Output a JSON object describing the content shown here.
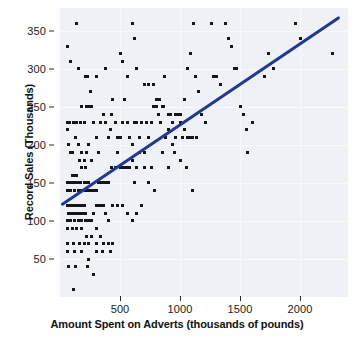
{
  "chart_data": {
    "type": "scatter",
    "title": "",
    "xlabel": "Amount Spent on Adverts (thousands of pounds)",
    "ylabel": "Record Sales (Thousands)",
    "xlim": [
      0,
      2400
    ],
    "ylim": [
      0,
      380
    ],
    "xticks": [
      500,
      1000,
      1500,
      2000
    ],
    "xticklabels": [
      "500",
      "1000",
      "1500",
      "2000"
    ],
    "yticks": [
      50,
      100,
      150,
      200,
      250,
      300,
      350
    ],
    "yticklabels": [
      "50",
      "100",
      "150",
      "200",
      "250",
      "300",
      "350"
    ],
    "grid": true,
    "legend": null,
    "panel_background": "#eef1f6",
    "point_color": "#15161a",
    "point_marker": "square",
    "series": [
      {
        "name": "Record sales vs advertising budget",
        "points": [
          [
            60,
            330
          ],
          [
            90,
            310
          ],
          [
            140,
            360
          ],
          [
            150,
            300
          ],
          [
            210,
            290
          ],
          [
            230,
            290
          ],
          [
            250,
            270
          ],
          [
            300,
            290
          ],
          [
            180,
            250
          ],
          [
            220,
            250
          ],
          [
            240,
            250
          ],
          [
            260,
            250
          ],
          [
            380,
            300
          ],
          [
            430,
            240
          ],
          [
            500,
            320
          ],
          [
            520,
            310
          ],
          [
            560,
            290
          ],
          [
            600,
            360
          ],
          [
            620,
            340
          ],
          [
            640,
            300
          ],
          [
            700,
            280
          ],
          [
            740,
            280
          ],
          [
            780,
            280
          ],
          [
            800,
            250
          ],
          [
            830,
            260
          ],
          [
            850,
            250
          ],
          [
            870,
            290
          ],
          [
            900,
            240
          ],
          [
            940,
            230
          ],
          [
            960,
            240
          ],
          [
            1000,
            240
          ],
          [
            1040,
            260
          ],
          [
            1060,
            300
          ],
          [
            1090,
            320
          ],
          [
            1110,
            360
          ],
          [
            1130,
            290
          ],
          [
            1150,
            270
          ],
          [
            1180,
            240
          ],
          [
            1210,
            230
          ],
          [
            1260,
            360
          ],
          [
            1280,
            290
          ],
          [
            1300,
            290
          ],
          [
            1340,
            280
          ],
          [
            1380,
            360
          ],
          [
            1400,
            340
          ],
          [
            1430,
            330
          ],
          [
            1450,
            300
          ],
          [
            1470,
            300
          ],
          [
            1500,
            250
          ],
          [
            1530,
            240
          ],
          [
            1550,
            220
          ],
          [
            1560,
            190
          ],
          [
            1600,
            230
          ],
          [
            1700,
            290
          ],
          [
            1740,
            320
          ],
          [
            1780,
            300
          ],
          [
            1960,
            360
          ],
          [
            2000,
            340
          ],
          [
            2270,
            320
          ],
          [
            60,
            230
          ],
          [
            80,
            230
          ],
          [
            110,
            230
          ],
          [
            140,
            230
          ],
          [
            170,
            230
          ],
          [
            200,
            230
          ],
          [
            60,
            220
          ],
          [
            70,
            200
          ],
          [
            90,
            190
          ],
          [
            100,
            190
          ],
          [
            130,
            210
          ],
          [
            150,
            200
          ],
          [
            160,
            180
          ],
          [
            180,
            190
          ],
          [
            200,
            180
          ],
          [
            220,
            190
          ],
          [
            240,
            200
          ],
          [
            260,
            180
          ],
          [
            280,
            230
          ],
          [
            300,
            210
          ],
          [
            320,
            190
          ],
          [
            340,
            230
          ],
          [
            360,
            240
          ],
          [
            380,
            230
          ],
          [
            400,
            210
          ],
          [
            420,
            220
          ],
          [
            440,
            260
          ],
          [
            460,
            230
          ],
          [
            480,
            210
          ],
          [
            500,
            210
          ],
          [
            520,
            230
          ],
          [
            540,
            260
          ],
          [
            560,
            230
          ],
          [
            580,
            210
          ],
          [
            600,
            200
          ],
          [
            620,
            230
          ],
          [
            640,
            230
          ],
          [
            660,
            210
          ],
          [
            680,
            230
          ],
          [
            700,
            190
          ],
          [
            720,
            230
          ],
          [
            740,
            210
          ],
          [
            760,
            230
          ],
          [
            780,
            250
          ],
          [
            800,
            260
          ],
          [
            820,
            240
          ],
          [
            840,
            230
          ],
          [
            860,
            250
          ],
          [
            880,
            210
          ],
          [
            900,
            220
          ],
          [
            920,
            240
          ],
          [
            940,
            200
          ],
          [
            960,
            210
          ],
          [
            980,
            240
          ],
          [
            1000,
            230
          ],
          [
            1020,
            210
          ],
          [
            1040,
            220
          ],
          [
            1060,
            210
          ],
          [
            1080,
            210
          ],
          [
            1100,
            210
          ],
          [
            1140,
            210
          ],
          [
            60,
            150
          ],
          [
            70,
            150
          ],
          [
            80,
            150
          ],
          [
            100,
            160
          ],
          [
            120,
            160
          ],
          [
            140,
            160
          ],
          [
            90,
            150
          ],
          [
            110,
            150
          ],
          [
            130,
            150
          ],
          [
            150,
            150
          ],
          [
            170,
            150
          ],
          [
            200,
            150
          ],
          [
            220,
            150
          ],
          [
            240,
            150
          ],
          [
            180,
            170
          ],
          [
            210,
            170
          ],
          [
            60,
            140
          ],
          [
            90,
            140
          ],
          [
            120,
            140
          ],
          [
            150,
            140
          ],
          [
            180,
            140
          ],
          [
            210,
            140
          ],
          [
            240,
            140
          ],
          [
            260,
            140
          ],
          [
            280,
            140
          ],
          [
            300,
            140
          ],
          [
            320,
            150
          ],
          [
            340,
            150
          ],
          [
            360,
            150
          ],
          [
            380,
            150
          ],
          [
            400,
            150
          ],
          [
            430,
            170
          ],
          [
            460,
            170
          ],
          [
            480,
            190
          ],
          [
            500,
            170
          ],
          [
            520,
            170
          ],
          [
            540,
            170
          ],
          [
            560,
            170
          ],
          [
            580,
            170
          ],
          [
            600,
            180
          ],
          [
            620,
            150
          ],
          [
            640,
            170
          ],
          [
            660,
            190
          ],
          [
            700,
            170
          ],
          [
            740,
            150
          ],
          [
            760,
            170
          ],
          [
            790,
            140
          ],
          [
            850,
            190
          ],
          [
            900,
            170
          ],
          [
            950,
            190
          ],
          [
            1000,
            180
          ],
          [
            1050,
            170
          ],
          [
            1100,
            140
          ],
          [
            60,
            120
          ],
          [
            80,
            120
          ],
          [
            100,
            120
          ],
          [
            120,
            120
          ],
          [
            140,
            120
          ],
          [
            160,
            120
          ],
          [
            180,
            120
          ],
          [
            200,
            120
          ],
          [
            70,
            110
          ],
          [
            90,
            110
          ],
          [
            110,
            110
          ],
          [
            130,
            110
          ],
          [
            150,
            110
          ],
          [
            170,
            110
          ],
          [
            190,
            110
          ],
          [
            210,
            110
          ],
          [
            60,
            100
          ],
          [
            90,
            100
          ],
          [
            120,
            100
          ],
          [
            150,
            100
          ],
          [
            180,
            100
          ],
          [
            210,
            100
          ],
          [
            240,
            100
          ],
          [
            260,
            100
          ],
          [
            280,
            110
          ],
          [
            300,
            120
          ],
          [
            320,
            120
          ],
          [
            340,
            120
          ],
          [
            360,
            120
          ],
          [
            380,
            110
          ],
          [
            400,
            100
          ],
          [
            440,
            120
          ],
          [
            480,
            120
          ],
          [
            520,
            120
          ],
          [
            560,
            110
          ],
          [
            600,
            100
          ],
          [
            640,
            110
          ],
          [
            680,
            120
          ],
          [
            60,
            90
          ],
          [
            100,
            90
          ],
          [
            140,
            90
          ],
          [
            180,
            90
          ],
          [
            220,
            80
          ],
          [
            260,
            80
          ],
          [
            300,
            90
          ],
          [
            340,
            80
          ],
          [
            60,
            70
          ],
          [
            110,
            70
          ],
          [
            160,
            70
          ],
          [
            200,
            70
          ],
          [
            240,
            70
          ],
          [
            300,
            70
          ],
          [
            360,
            70
          ],
          [
            400,
            70
          ],
          [
            440,
            70
          ],
          [
            60,
            60
          ],
          [
            120,
            60
          ],
          [
            180,
            60
          ],
          [
            240,
            50
          ],
          [
            300,
            60
          ],
          [
            350,
            60
          ],
          [
            420,
            60
          ],
          [
            70,
            40
          ],
          [
            130,
            40
          ],
          [
            230,
            40
          ],
          [
            280,
            30
          ],
          [
            110,
            10
          ]
        ]
      }
    ],
    "trendline": {
      "name": "linear-regression-line",
      "color": "#22398f",
      "width_px": 3,
      "x_start": 20,
      "y_start": 122,
      "x_end": 2320,
      "y_end": 367
    }
  }
}
